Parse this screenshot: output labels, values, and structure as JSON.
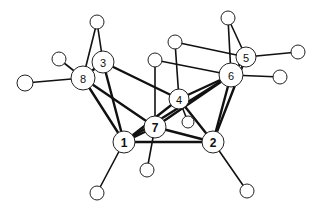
{
  "diagram": {
    "type": "molecular-structure",
    "labeled_atoms": [
      {
        "id": "1",
        "label": "1",
        "x": 124,
        "y": 142,
        "r": 11,
        "bold": true
      },
      {
        "id": "2",
        "label": "2",
        "x": 213,
        "y": 142,
        "r": 11,
        "bold": true
      },
      {
        "id": "3",
        "label": "3",
        "x": 103,
        "y": 62,
        "r": 11,
        "bold": false
      },
      {
        "id": "4",
        "label": "4",
        "x": 179,
        "y": 99,
        "r": 10,
        "bold": false
      },
      {
        "id": "5",
        "label": "5",
        "x": 246,
        "y": 57,
        "r": 10,
        "bold": false
      },
      {
        "id": "6",
        "label": "6",
        "x": 231,
        "y": 75,
        "r": 12,
        "bold": false
      },
      {
        "id": "7",
        "label": "7",
        "x": 155,
        "y": 127,
        "r": 11,
        "bold": true
      },
      {
        "id": "8",
        "label": "8",
        "x": 83,
        "y": 78,
        "r": 12,
        "bold": false
      }
    ],
    "unlabeled_atoms": [
      {
        "id": "h3a",
        "x": 97,
        "y": 22,
        "r": 7
      },
      {
        "id": "h3b",
        "x": 59,
        "y": 59,
        "r": 7
      },
      {
        "id": "h8",
        "x": 25,
        "y": 83,
        "r": 8
      },
      {
        "id": "h7a",
        "x": 155,
        "y": 60,
        "r": 7
      },
      {
        "id": "h4a",
        "x": 175,
        "y": 42,
        "r": 7
      },
      {
        "id": "h5a",
        "x": 228,
        "y": 18,
        "r": 7
      },
      {
        "id": "h5b",
        "x": 298,
        "y": 52,
        "r": 7
      },
      {
        "id": "h6",
        "x": 280,
        "y": 77,
        "r": 7
      },
      {
        "id": "h4b",
        "x": 188,
        "y": 122,
        "r": 6
      },
      {
        "id": "h7b",
        "x": 147,
        "y": 170,
        "r": 7
      },
      {
        "id": "h1",
        "x": 97,
        "y": 193,
        "r": 7
      },
      {
        "id": "h2",
        "x": 247,
        "y": 191,
        "r": 7
      }
    ],
    "bonds": [
      {
        "a": "1",
        "b": "2",
        "thick": true
      },
      {
        "a": "1",
        "b": "3",
        "thick": true
      },
      {
        "a": "1",
        "b": "8",
        "thick": true
      },
      {
        "a": "1",
        "b": "7",
        "thick": true
      },
      {
        "a": "1",
        "b": "4",
        "thick": true
      },
      {
        "a": "1",
        "b": "6",
        "thick": true
      },
      {
        "a": "2",
        "b": "7",
        "thick": true
      },
      {
        "a": "2",
        "b": "4",
        "thick": true
      },
      {
        "a": "2",
        "b": "6",
        "thick": true
      },
      {
        "a": "2",
        "b": "5",
        "thick": true
      },
      {
        "a": "3",
        "b": "4",
        "thick": true
      },
      {
        "a": "3",
        "b": "8",
        "thick": true
      },
      {
        "a": "8",
        "b": "7",
        "thick": true
      },
      {
        "a": "7",
        "b": "6",
        "thick": true
      },
      {
        "a": "4",
        "b": "6",
        "thick": true
      },
      {
        "a": "6",
        "b": "5",
        "thick": true
      },
      {
        "a": "3",
        "b": "h3a",
        "thick": false
      },
      {
        "a": "8",
        "b": "h3a",
        "thick": false
      },
      {
        "a": "8",
        "b": "h3b",
        "thick": false
      },
      {
        "a": "8",
        "b": "h8",
        "thick": false
      },
      {
        "a": "7",
        "b": "h7a",
        "thick": false
      },
      {
        "a": "7",
        "b": "h7b",
        "thick": false
      },
      {
        "a": "4",
        "b": "h4a",
        "thick": false
      },
      {
        "a": "4",
        "b": "h4b",
        "thick": false
      },
      {
        "a": "6",
        "b": "h5a",
        "thick": false
      },
      {
        "a": "5",
        "b": "h5a",
        "thick": false
      },
      {
        "a": "5",
        "b": "h5b",
        "thick": false
      },
      {
        "a": "6",
        "b": "h6",
        "thick": false
      },
      {
        "a": "6",
        "b": "h7a",
        "thick": false
      },
      {
        "a": "5",
        "b": "h4a",
        "thick": false
      },
      {
        "a": "1",
        "b": "h1",
        "thick": false
      },
      {
        "a": "2",
        "b": "h2",
        "thick": false
      }
    ]
  }
}
